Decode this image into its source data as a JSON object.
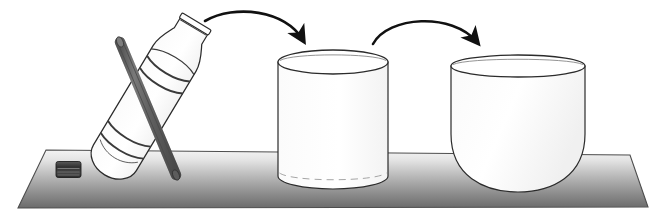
{
  "illustration": {
    "title": "Pouring liquid from a bottle into a cylindrical cup and then into a bowl-shaped cup",
    "caption": "",
    "background_color": "#ffffff",
    "outline_color": "#2b2b2b",
    "glass_fill": "#fdfdfd",
    "arrow_color": "#121212",
    "rod_color": "#6e6e6e",
    "rod_dark_color": "#4a4a4a",
    "cap_color": "#3a3a3a",
    "table": {
      "name": "table-surface",
      "top_color": "#f2f2f2",
      "bottom_color": "#6f6f6f",
      "edge_color": "#555555",
      "corners": "top-left (46,150), top-right (630,155), bottom-right (648,207), bottom-left (18,208)"
    },
    "objects": [
      {
        "id": "bottle",
        "label": "tilted plastic bottle with rod inside",
        "tilt_degrees": 30
      },
      {
        "id": "bottle-cap",
        "label": "bottle cap lying on table"
      },
      {
        "id": "rod",
        "label": "dark rod inside bottle"
      },
      {
        "id": "cylinder-cup",
        "label": "cylindrical cup"
      },
      {
        "id": "bowl-cup",
        "label": "bowl-shaped cup"
      },
      {
        "id": "arrow-1",
        "label": "curved arrow from bottle to cylindrical cup"
      },
      {
        "id": "arrow-2",
        "label": "curved arrow from cylindrical cup to bowl cup"
      }
    ]
  }
}
